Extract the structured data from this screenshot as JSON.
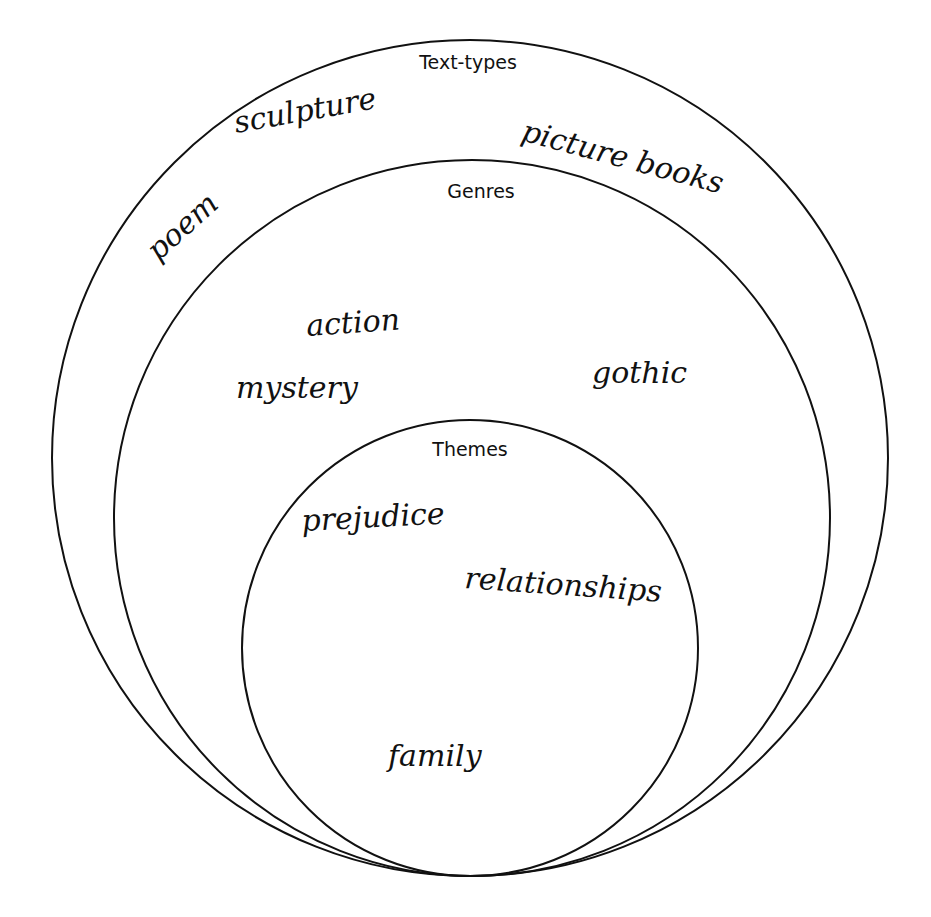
{
  "diagram": {
    "type": "nested-circles",
    "levels": [
      {
        "heading": "Text-types",
        "items": [
          "sculpture",
          "picture books",
          "poem"
        ]
      },
      {
        "heading": "Genres",
        "items": [
          "action",
          "mystery",
          "gothic"
        ]
      },
      {
        "heading": "Themes",
        "items": [
          "prejudice",
          "relationships",
          "family"
        ]
      }
    ],
    "colors": {
      "stroke": "#111111",
      "background": "#ffffff"
    }
  }
}
